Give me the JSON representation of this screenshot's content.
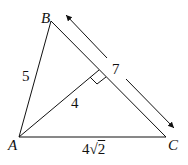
{
  "diagram": {
    "vertices": {
      "A": {
        "label": "A",
        "x": 19,
        "y": 137
      },
      "B": {
        "label": "B",
        "x": 51,
        "y": 21
      },
      "C": {
        "label": "C",
        "x": 166,
        "y": 137
      }
    },
    "altitude_foot": {
      "x": 99,
      "y": 70
    },
    "labels": {
      "AB": "5",
      "altitude": "4",
      "BC": "7",
      "AC_coef": "4",
      "AC_radicand": "2"
    },
    "right_angle_marker": true,
    "arrow_dimension_BC": {
      "from": [
        65,
        14
      ],
      "to": [
        175,
        129
      ],
      "label": "7"
    }
  }
}
